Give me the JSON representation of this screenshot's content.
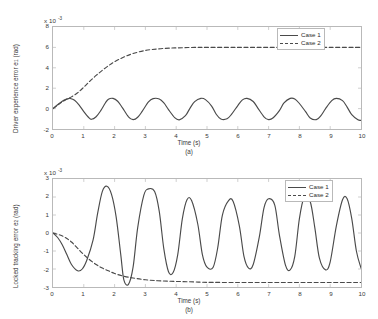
{
  "figure": {
    "background": "#ffffff",
    "axis_color": "#b9b9b9",
    "line_color": "#4a4a4a"
  },
  "chart_data": [
    {
      "type": "line",
      "panel": "a",
      "title": "",
      "xlabel": "Time (s)",
      "ylabel": "Driver experience error e1 (rad)",
      "ylabel_main": "Driver experience error e",
      "ylabel_sub": "1",
      "ylabel_unit": " (rad)",
      "exponent_prefix": "x 10",
      "exponent_power": "-3",
      "subplot_label": "(a)",
      "xlim": [
        0,
        10
      ],
      "ylim": [
        -2,
        8
      ],
      "xticks": [
        "0",
        "1",
        "2",
        "3",
        "4",
        "5",
        "6",
        "7",
        "8",
        "9",
        "10"
      ],
      "xtick_values": [
        0,
        1,
        2,
        3,
        4,
        5,
        6,
        7,
        8,
        9,
        10
      ],
      "yticks": [
        "8",
        "6",
        "4",
        "2",
        "0",
        "-2"
      ],
      "ytick_values": [
        8,
        6,
        4,
        2,
        0,
        -2
      ],
      "grid": false,
      "legend_position": "upper right",
      "series": [
        {
          "name": "Case 1",
          "style": "solid",
          "description": "Rises to a small peak near t=0.55 then settles into a steady sinusoidal oscillation between about -1.1e-3 and 1.0e-3 with period ~1.33 s",
          "x": [
            0,
            0.1,
            0.2,
            0.3,
            0.4,
            0.5,
            0.55,
            0.7,
            0.85,
            1.0,
            1.15,
            1.25,
            1.4,
            1.55,
            1.7,
            1.8,
            1.95,
            2.1,
            2.25,
            2.45,
            2.6,
            2.75,
            2.9,
            3.1,
            3.25,
            3.45,
            3.6,
            3.75,
            3.95,
            4.1,
            4.3,
            4.45,
            4.6,
            4.8,
            4.95,
            5.15,
            5.3,
            5.45,
            5.65,
            5.8,
            6.0,
            6.15,
            6.3,
            6.5,
            6.65,
            6.85,
            7.0,
            7.15,
            7.35,
            7.5,
            7.7,
            7.85,
            8.0,
            8.2,
            8.35,
            8.55,
            8.7,
            8.85,
            9.05,
            9.2,
            9.4,
            9.55,
            9.7,
            9.9,
            10.0
          ],
          "y": [
            0.0,
            0.25,
            0.5,
            0.72,
            0.88,
            0.98,
            1.0,
            0.82,
            0.35,
            -0.3,
            -0.85,
            -1.05,
            -0.8,
            -0.2,
            0.55,
            0.92,
            1.0,
            0.72,
            0.1,
            -0.8,
            -1.08,
            -0.85,
            -0.25,
            0.65,
            0.98,
            0.95,
            0.55,
            -0.1,
            -0.88,
            -1.1,
            -0.7,
            0.05,
            0.68,
            1.0,
            0.88,
            0.25,
            -0.55,
            -1.02,
            -1.0,
            -0.55,
            0.3,
            0.85,
            1.0,
            0.7,
            0.05,
            -0.8,
            -1.08,
            -0.9,
            -0.2,
            0.55,
            1.0,
            0.95,
            0.5,
            -0.3,
            -0.92,
            -1.08,
            -0.68,
            0.0,
            0.78,
            1.0,
            0.78,
            0.15,
            -0.6,
            -1.1,
            -1.15
          ]
        },
        {
          "name": "Case 2",
          "style": "dashed",
          "description": "Smooth exponential-like rise from 0 saturating at about 6.0e-3 by t~4.5 s and flat thereafter",
          "x": [
            0,
            0.2,
            0.4,
            0.6,
            0.8,
            1.0,
            1.2,
            1.4,
            1.6,
            1.8,
            2.0,
            2.3,
            2.6,
            3.0,
            3.4,
            3.8,
            4.2,
            4.6,
            5.0,
            6.0,
            7.0,
            8.0,
            9.0,
            10.0
          ],
          "y": [
            0.0,
            0.45,
            0.85,
            1.15,
            1.55,
            2.1,
            2.7,
            3.25,
            3.75,
            4.2,
            4.6,
            5.05,
            5.4,
            5.7,
            5.85,
            5.93,
            5.97,
            6.0,
            6.0,
            6.0,
            6.0,
            6.0,
            6.0,
            6.0
          ]
        }
      ]
    },
    {
      "type": "line",
      "panel": "b",
      "title": "",
      "xlabel": "Time (s)",
      "ylabel": "Locked tracking error e2 (rad)",
      "ylabel_main": "Locked tracking error e",
      "ylabel_sub": "2",
      "ylabel_unit": " (rad)",
      "exponent_prefix": "x 10",
      "exponent_power": "-3",
      "subplot_label": "(b)",
      "xlim": [
        0,
        10
      ],
      "ylim": [
        -3,
        3
      ],
      "xticks": [
        "0",
        "1",
        "2",
        "3",
        "4",
        "5",
        "6",
        "7",
        "8",
        "9",
        "10"
      ],
      "xtick_values": [
        0,
        1,
        2,
        3,
        4,
        5,
        6,
        7,
        8,
        9,
        10
      ],
      "yticks": [
        "3",
        "2",
        "1",
        "0",
        "-1",
        "-2",
        "-3"
      ],
      "ytick_values": [
        3,
        2,
        1,
        0,
        -1,
        -2,
        -3
      ],
      "grid": false,
      "legend_position": "upper right",
      "series": [
        {
          "name": "Case 1",
          "style": "solid",
          "description": "Dips to about -2.1e-3 near t=0.8, then large oscillation peaking at 2.6e-3 near t=1.6 and -2.85e-3 near t=2.3, settling into a sustained oscillation roughly between -2.0e-3 and 1.9e-3 with period ~1.27 s",
          "x": [
            0,
            0.15,
            0.3,
            0.45,
            0.6,
            0.8,
            0.95,
            1.1,
            1.3,
            1.45,
            1.6,
            1.75,
            1.9,
            2.05,
            2.2,
            2.3,
            2.45,
            2.6,
            2.75,
            2.95,
            3.1,
            3.3,
            3.45,
            3.6,
            3.75,
            3.9,
            4.05,
            4.2,
            4.35,
            4.5,
            4.7,
            4.85,
            5.0,
            5.2,
            5.35,
            5.5,
            5.7,
            5.85,
            6.05,
            6.2,
            6.35,
            6.5,
            6.7,
            6.85,
            7.0,
            7.2,
            7.35,
            7.55,
            7.7,
            7.85,
            8.0,
            8.15,
            8.35,
            8.5,
            8.65,
            8.85,
            9.0,
            9.2,
            9.4,
            9.55,
            9.7,
            9.85,
            10.0
          ],
          "y": [
            0.0,
            -0.25,
            -0.65,
            -1.2,
            -1.75,
            -2.1,
            -2.0,
            -1.5,
            -0.4,
            1.1,
            2.3,
            2.6,
            2.15,
            0.9,
            -1.2,
            -2.6,
            -2.85,
            -1.9,
            0.3,
            2.1,
            2.45,
            2.3,
            1.2,
            -0.9,
            -2.15,
            -2.2,
            -1.2,
            0.8,
            1.85,
            1.8,
            0.5,
            -1.2,
            -1.9,
            -1.9,
            -0.8,
            1.0,
            1.8,
            1.75,
            0.4,
            -1.3,
            -1.95,
            -1.75,
            -0.2,
            1.4,
            1.9,
            1.55,
            -0.1,
            -1.8,
            -2.05,
            -1.3,
            0.8,
            1.95,
            1.75,
            0.3,
            -1.4,
            -2.05,
            -1.6,
            0.4,
            1.85,
            1.9,
            0.8,
            -1.0,
            -1.95
          ]
        },
        {
          "name": "Case 2",
          "style": "dashed",
          "description": "Smooth monotone decay from 0 toward a plateau of about -2.75e-3 reached by t~5 s",
          "x": [
            0,
            0.2,
            0.4,
            0.6,
            0.8,
            1.0,
            1.2,
            1.4,
            1.6,
            1.8,
            2.0,
            2.3,
            2.6,
            3.0,
            3.4,
            3.8,
            4.2,
            4.6,
            5.0,
            6.0,
            7.0,
            8.0,
            9.0,
            10.0
          ],
          "y": [
            0.0,
            -0.1,
            -0.25,
            -0.5,
            -0.85,
            -1.2,
            -1.5,
            -1.75,
            -1.95,
            -2.1,
            -2.25,
            -2.4,
            -2.5,
            -2.6,
            -2.65,
            -2.68,
            -2.7,
            -2.72,
            -2.74,
            -2.75,
            -2.75,
            -2.75,
            -2.75,
            -2.75
          ]
        }
      ]
    }
  ],
  "legend": {
    "entries": [
      {
        "label": "Case 1",
        "style": "solid"
      },
      {
        "label": "Case 2",
        "style": "dashed"
      }
    ]
  }
}
